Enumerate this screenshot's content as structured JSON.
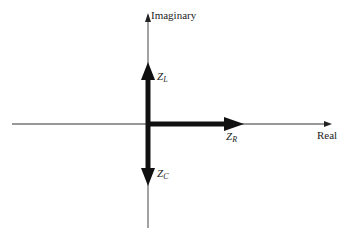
{
  "diagram": {
    "axes": {
      "vertical_label": "Imaginary",
      "horizontal_label": "Real"
    },
    "vectors": [
      {
        "name": "Z",
        "sub": "L",
        "direction": "up"
      },
      {
        "name": "Z",
        "sub": "R",
        "direction": "right"
      },
      {
        "name": "Z",
        "sub": "C",
        "direction": "down"
      }
    ],
    "colors": {
      "line": "#222222",
      "background": "#ffffff"
    }
  }
}
